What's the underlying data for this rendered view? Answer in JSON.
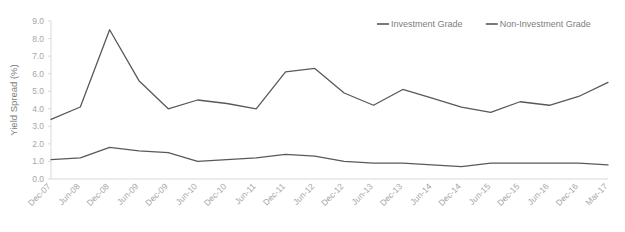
{
  "chart_data": {
    "type": "line",
    "title": "",
    "xlabel": "",
    "ylabel": "Yield Spread (%)",
    "ylim": [
      0.0,
      9.0
    ],
    "ytick_step": 1.0,
    "yticks": [
      "0.0",
      "1.0",
      "2.0",
      "3.0",
      "4.0",
      "5.0",
      "6.0",
      "7.0",
      "8.0",
      "9.0"
    ],
    "grid": false,
    "legend_position": "top-right",
    "categories": [
      "Dec-07",
      "Jun-08",
      "Dec-08",
      "Jun-09",
      "Dec-09",
      "Jun-10",
      "Dec-10",
      "Jun-11",
      "Dec-11",
      "Jun-12",
      "Dec-12",
      "Jun-13",
      "Dec-13",
      "Jun-14",
      "Dec-14",
      "Jun-15",
      "Dec-15",
      "Jun-16",
      "Dec-16",
      "Mar-17"
    ],
    "series": [
      {
        "name": "Investment Grade",
        "color": "#595959",
        "values": [
          3.4,
          4.1,
          8.5,
          5.6,
          4.0,
          4.5,
          4.3,
          4.0,
          6.1,
          6.3,
          4.9,
          4.2,
          5.1,
          4.6,
          4.1,
          3.8,
          4.4,
          4.2,
          4.7,
          5.5
        ]
      },
      {
        "name": "Non-Investment Grade",
        "color": "#595959",
        "values": [
          1.1,
          1.2,
          1.8,
          1.6,
          1.5,
          1.0,
          1.1,
          1.2,
          1.4,
          1.3,
          1.0,
          0.9,
          0.9,
          0.8,
          0.7,
          0.9,
          0.9,
          0.9,
          0.9,
          0.8
        ]
      }
    ]
  },
  "axis": {
    "y_title": "Yield Spread (%)"
  },
  "legend": {
    "items": [
      {
        "label": "Investment Grade"
      },
      {
        "label": "Non-Investment Grade"
      }
    ]
  }
}
